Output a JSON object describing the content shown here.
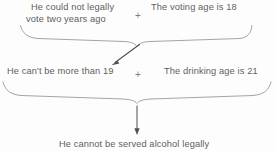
{
  "diagram": {
    "type": "flow-diagram",
    "canvas": {
      "width": 276,
      "height": 151,
      "background": "#fdfdfd"
    },
    "colors": {
      "text": "#5f5f5f",
      "stroke": "#9a9a9a",
      "arrow": "#4a4a4a",
      "plus": "#7d7d7d"
    },
    "row1": {
      "premise_left_line1": "He could not legally",
      "premise_left_line2": "vote two years ago",
      "operator": "+",
      "premise_right": "The voting age is 18"
    },
    "row2": {
      "premise_left": "He can't be more than 19",
      "operator": "+",
      "premise_right": "The drinking age is 21"
    },
    "conclusion": "He cannot be served alcohol legally",
    "connectors": [
      {
        "name": "brace-top",
        "shape": "curly-brace-down",
        "x_start": 20,
        "x_end": 250,
        "apex_x": 137,
        "apex_y": 46
      },
      {
        "name": "arrow-diagonal",
        "shape": "arrow",
        "from_x": 139,
        "from_y": 44,
        "to_x": 112,
        "to_y": 64
      },
      {
        "name": "brace-bottom",
        "shape": "curly-brace-down",
        "x_start": 3,
        "x_end": 271,
        "apex_x": 137,
        "apex_y": 103
      },
      {
        "name": "arrow-vertical",
        "shape": "arrow",
        "from_x": 137,
        "from_y": 106,
        "to_x": 137,
        "to_y": 134
      }
    ]
  }
}
